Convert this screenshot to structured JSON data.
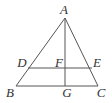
{
  "diagram": {
    "type": "geometry",
    "stroke_color": "#555555",
    "points": {
      "A": {
        "label": "A",
        "x": 65,
        "y": 18,
        "lx": 64,
        "ly": 14
      },
      "B": {
        "label": "B",
        "x": 16,
        "y": 86,
        "lx": 10,
        "ly": 97
      },
      "C": {
        "label": "C",
        "x": 98,
        "y": 86,
        "lx": 101,
        "ly": 97
      },
      "D": {
        "label": "D",
        "x": 28,
        "y": 68,
        "lx": 22,
        "ly": 67
      },
      "E": {
        "label": "E",
        "x": 92,
        "y": 68,
        "lx": 97,
        "ly": 67
      },
      "F": {
        "label": "F",
        "x": 65,
        "y": 68,
        "lx": 59,
        "ly": 67
      },
      "G": {
        "label": "G",
        "x": 65,
        "y": 86,
        "lx": 67,
        "ly": 97
      }
    },
    "segments": [
      [
        "A",
        "B"
      ],
      [
        "A",
        "C"
      ],
      [
        "B",
        "C"
      ],
      [
        "A",
        "G"
      ],
      [
        "D",
        "E"
      ]
    ]
  }
}
